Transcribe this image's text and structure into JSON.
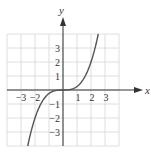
{
  "chart_data": {
    "type": "line",
    "title": "",
    "xlabel": "x",
    "ylabel": "y",
    "xlim": [
      -4,
      4
    ],
    "ylim": [
      -4,
      4
    ],
    "grid": true,
    "x_ticks": [
      -3,
      -2,
      1,
      2,
      3
    ],
    "x_tick_labels": [
      "−3",
      "−2",
      "1",
      "2",
      "3"
    ],
    "y_ticks": [
      3,
      2,
      1,
      -1,
      -2,
      -3
    ],
    "y_tick_labels": [
      "3",
      "2",
      "1",
      "−1",
      "−2",
      "−3"
    ],
    "series": [
      {
        "name": "y = x^3/4",
        "function": "x^3/4",
        "x_range": [
          -2.52,
          2.52
        ],
        "color": "#555555"
      }
    ]
  }
}
